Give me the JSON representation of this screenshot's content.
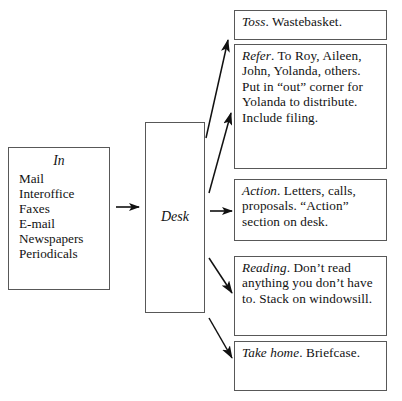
{
  "diagram": {
    "line_color": "#585858",
    "arrow_color": "#111111",
    "background": "#ffffff"
  },
  "in_box": {
    "title": "In",
    "items": [
      "Mail",
      "Interoffice",
      "Faxes",
      "E-mail",
      "Newspapers",
      "Periodicals"
    ]
  },
  "desk_box": {
    "label": "Desk"
  },
  "outputs": [
    {
      "key": "toss",
      "lead": "Toss",
      "body": ". Wastebasket."
    },
    {
      "key": "refer",
      "lead": "Refer",
      "body": ". To Roy, Aileen, John, Yolanda, others. Put in “out” corner for Yolanda to distribute. Include filing."
    },
    {
      "key": "action",
      "lead": "Action",
      "body": ". Letters, calls, proposals. “Action” section on desk."
    },
    {
      "key": "reading",
      "lead": "Reading",
      "body": ". Don’t read anything you don’t have to. Stack on windowsill."
    },
    {
      "key": "take-home",
      "lead": "Take home",
      "body": ". Briefcase."
    }
  ],
  "arrows": [
    {
      "name": "in-to-desk",
      "direction": "right"
    },
    {
      "name": "desk-to-toss",
      "direction": "up-right"
    },
    {
      "name": "desk-to-refer",
      "direction": "up-right"
    },
    {
      "name": "desk-to-action",
      "direction": "right"
    },
    {
      "name": "desk-to-reading",
      "direction": "down-right"
    },
    {
      "name": "desk-to-take-home",
      "direction": "down-right"
    }
  ]
}
